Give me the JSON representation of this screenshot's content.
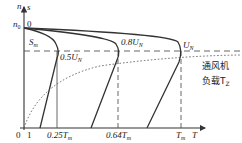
{
  "diagram": {
    "title": "",
    "axes": {
      "y_label_n": "n",
      "y_label_s": "s",
      "x_label": "T",
      "origin": "0",
      "x_one": "1",
      "n0_label": "n",
      "n0_sub": "0",
      "s0_label": "0"
    },
    "slip_label": "S",
    "slip_sub": "m",
    "curves": [
      {
        "name": "0.5U",
        "sub": "N",
        "text": "0.5U"
      },
      {
        "name": "0.8U",
        "sub": "N",
        "text": "0.8U"
      },
      {
        "name": "U",
        "sub": "N",
        "text": "U"
      }
    ],
    "x_ticks": [
      {
        "text": "0.25T",
        "sub": "m"
      },
      {
        "text": "0.64T",
        "sub": "m"
      },
      {
        "text": "T",
        "sub": "m"
      }
    ],
    "load_curve": {
      "line1": "通风机",
      "line2": "负载T",
      "sub": "Z"
    }
  }
}
